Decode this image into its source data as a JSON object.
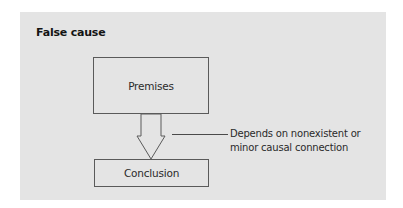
{
  "figure": {
    "title": "False cause",
    "nodes": {
      "premises": {
        "label": "Premises"
      },
      "conclusion": {
        "label": "Conclusion"
      }
    },
    "edge": {
      "from": "premises",
      "to": "conclusion",
      "style": "hollow-block-arrow"
    },
    "annotation": {
      "line1": "Depends on nonexistent or",
      "line2": "minor causal connection"
    },
    "colors": {
      "panel_background": "#e4e4e4",
      "stroke": "#5a5a5a",
      "text": "#2a2a2a"
    }
  }
}
